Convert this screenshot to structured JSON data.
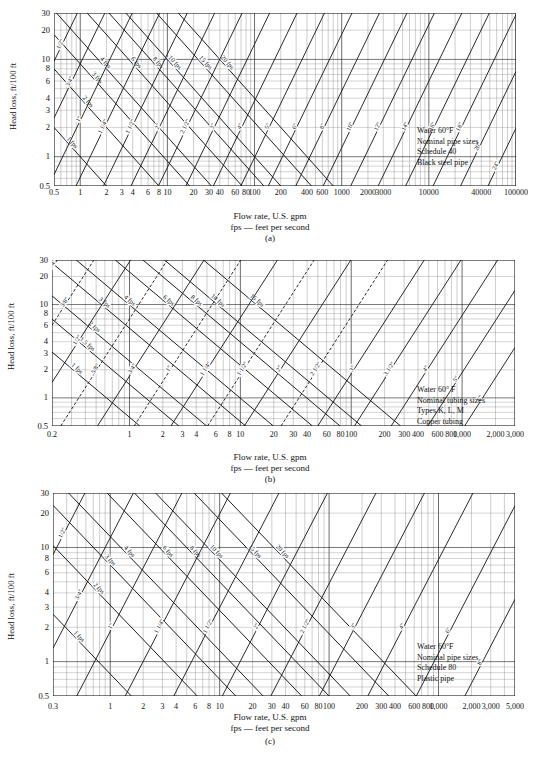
{
  "figure": {
    "axis_caption_line1": "Flow rate, U.S. gpm",
    "axis_caption_line2": "fps — feet per second",
    "y_axis_label": "Head loss, ft/100 ft"
  },
  "panels": [
    {
      "letter": "(a)",
      "legend": [
        "Water 60°F",
        "Nominal pipe sizes",
        "Schedule 40",
        "Black steel pipe"
      ],
      "y_ticks": [
        "30",
        "20",
        "10",
        "8",
        "6",
        "4",
        "3",
        "2",
        "1",
        "0.5"
      ],
      "x_ticks": [
        "0.5",
        "1",
        "2",
        "3",
        "4",
        "6",
        "8",
        "10",
        "20",
        "30",
        "40",
        "60",
        "80",
        "100",
        "200",
        "400",
        "600",
        "1000",
        "2000",
        "3000",
        "10000",
        "40000",
        "100000"
      ],
      "velocity_labels": [
        "1 fps",
        "2 fps",
        "3 fps",
        "4 fps",
        "6 fps",
        "8 fps",
        "10 fps",
        "15 fps",
        "20 fps"
      ],
      "pipe_size_labels": [
        "1/2\"",
        "3/4\"",
        "1\"",
        "1 1/4\"",
        "1 1/2\"",
        "2\"",
        "2 1/2\"",
        "3\"",
        "4\"",
        "5\"",
        "6\"",
        "8\"",
        "10\"",
        "12\"",
        "14\"",
        "16\"",
        "18\"",
        "20\"",
        "24\""
      ]
    },
    {
      "letter": "(b)",
      "legend": [
        "Water 60° F",
        "Nominal tubing sizes",
        "Types K, L, M",
        "Copper tubing"
      ],
      "y_ticks": [
        "30",
        "20",
        "10",
        "8",
        "6",
        "4",
        "3",
        "2",
        "1",
        "0.5"
      ],
      "x_ticks": [
        "0.2",
        "1",
        "2",
        "3",
        "4",
        "6",
        "8",
        "10",
        "20",
        "30",
        "40",
        "60",
        "80",
        "100",
        "200",
        "300",
        "400",
        "600",
        "800",
        "1,000",
        "2,000",
        "3,000"
      ],
      "velocity_labels": [
        "1 fps",
        "1.5 fps",
        "2 fps",
        "3 fps",
        "4 fps",
        "6 fps",
        "8 fps",
        "10 fps",
        "15 fps"
      ],
      "pipe_size_labels": [
        "1/4\"",
        "3/8\"",
        "1/2\"",
        "5/8\"",
        "3/4\"",
        "1\"",
        "1 1/4\"",
        "1 1/2\"",
        "2\"",
        "2 1/2\"",
        "3\"",
        "3 1/2\"",
        "4\"",
        "5\"",
        "6\""
      ]
    },
    {
      "letter": "(c)",
      "legend": [
        "Water 60°F",
        "Nominal pipe sizes",
        "Schedule 80",
        "Plastic pipe"
      ],
      "y_ticks": [
        "30",
        "20",
        "10",
        "8",
        "6",
        "4",
        "3",
        "2",
        "1",
        "0.5"
      ],
      "x_ticks": [
        "0.3",
        "1",
        "2",
        "3",
        "4",
        "6",
        "8",
        "10",
        "20",
        "30",
        "40",
        "60",
        "80",
        "100",
        "200",
        "300",
        "400",
        "600",
        "800",
        "1,000",
        "2,000",
        "3,000",
        "5,000"
      ],
      "velocity_labels": [
        "1 fps",
        "2 fps",
        "3 fps",
        "4 fps",
        "6 fps",
        "8 fps",
        "10 fps",
        "15 fps",
        "20 fps"
      ],
      "pipe_size_labels": [
        "1/2\"",
        "3/4\"",
        "1\"",
        "1 1/4\"",
        "1 1/2\"",
        "2\"",
        "2 1/2\"",
        "3\"",
        "4\"",
        "6\"",
        "8\""
      ]
    }
  ],
  "chart_data": [
    {
      "type": "line",
      "panel": "(a)",
      "title": "Head loss vs flow rate — Schedule 40 black steel pipe, water 60°F",
      "xlabel": "Flow rate, U.S. gpm",
      "ylabel": "Head loss, ft/100 ft",
      "xscale": "log",
      "yscale": "log",
      "xlim": [
        0.5,
        100000
      ],
      "ylim": [
        0.5,
        30
      ],
      "grid": true,
      "legend_position": "inside-right",
      "annotations": [
        "Water 60°F",
        "Nominal pipe sizes",
        "Schedule 40",
        "Black steel pipe"
      ],
      "x_tick_values": [
        0.5,
        1,
        2,
        3,
        4,
        6,
        8,
        10,
        20,
        30,
        40,
        60,
        80,
        100,
        200,
        400,
        600,
        1000,
        2000,
        3000,
        10000,
        40000,
        100000
      ],
      "y_tick_values": [
        0.5,
        1,
        2,
        3,
        4,
        6,
        8,
        10,
        20,
        30
      ],
      "series": [
        {
          "name": "1 fps",
          "kind": "velocity",
          "slope": -1.0,
          "points": [
            [
              0.5,
              2.0
            ],
            [
              100000,
              0.0002
            ]
          ]
        },
        {
          "name": "2 fps",
          "kind": "velocity",
          "slope": -1.0,
          "points": [
            [
              0.5,
              10.0
            ],
            [
              100000,
              0.001
            ]
          ]
        },
        {
          "name": "3 fps",
          "kind": "velocity",
          "slope": -1.0,
          "points": [
            [
              1.0,
              30.0
            ],
            [
              100000,
              0.004
            ]
          ]
        },
        {
          "name": "4 fps",
          "kind": "velocity",
          "slope": -1.0,
          "points": [
            [
              2.0,
              30.0
            ],
            [
              100000,
              0.01
            ]
          ]
        },
        {
          "name": "6 fps",
          "kind": "velocity",
          "slope": -1.0,
          "points": [
            [
              6.0,
              30.0
            ],
            [
              100000,
              0.03
            ]
          ]
        },
        {
          "name": "8 fps",
          "kind": "velocity",
          "slope": -1.0,
          "points": [
            [
              15.0,
              30.0
            ],
            [
              100000,
              0.06
            ]
          ]
        },
        {
          "name": "10 fps",
          "kind": "velocity",
          "slope": -1.0,
          "points": [
            [
              40.0,
              30.0
            ],
            [
              100000,
              0.1
            ]
          ]
        },
        {
          "name": "15 fps",
          "kind": "velocity",
          "slope": -1.0,
          "points": [
            [
              200.0,
              30.0
            ],
            [
              100000,
              0.25
            ]
          ]
        },
        {
          "name": "20 fps",
          "kind": "velocity",
          "slope": -1.0,
          "points": [
            [
              700.0,
              30.0
            ],
            [
              100000,
              0.5
            ]
          ]
        },
        {
          "name": "1/2\"",
          "kind": "pipe-size",
          "slope": 1.85
        },
        {
          "name": "3/4\"",
          "kind": "pipe-size",
          "slope": 1.85
        },
        {
          "name": "1\"",
          "kind": "pipe-size",
          "slope": 1.85
        },
        {
          "name": "1 1/4\"",
          "kind": "pipe-size",
          "slope": 1.85
        },
        {
          "name": "1 1/2\"",
          "kind": "pipe-size",
          "slope": 1.85
        },
        {
          "name": "2\"",
          "kind": "pipe-size",
          "slope": 1.85
        },
        {
          "name": "2 1/2\"",
          "kind": "pipe-size",
          "slope": 1.85
        },
        {
          "name": "3\"",
          "kind": "pipe-size",
          "slope": 1.85
        },
        {
          "name": "4\"",
          "kind": "pipe-size",
          "slope": 1.85
        },
        {
          "name": "5\"",
          "kind": "pipe-size",
          "slope": 1.85
        },
        {
          "name": "6\"",
          "kind": "pipe-size",
          "slope": 1.85
        },
        {
          "name": "8\"",
          "kind": "pipe-size",
          "slope": 1.85
        },
        {
          "name": "10\"",
          "kind": "pipe-size",
          "slope": 1.85
        },
        {
          "name": "12\"",
          "kind": "pipe-size",
          "slope": 1.85
        },
        {
          "name": "14\"",
          "kind": "pipe-size",
          "slope": 1.85
        },
        {
          "name": "16\"",
          "kind": "pipe-size",
          "slope": 1.85
        },
        {
          "name": "18\"",
          "kind": "pipe-size",
          "slope": 1.85
        },
        {
          "name": "20\"",
          "kind": "pipe-size",
          "slope": 1.85
        },
        {
          "name": "24\"",
          "kind": "pipe-size",
          "slope": 1.85
        }
      ]
    },
    {
      "type": "line",
      "panel": "(b)",
      "title": "Head loss vs flow rate — Copper tubing Types K, L, M, water 60°F",
      "xlabel": "Flow rate, U.S. gpm",
      "ylabel": "Head loss, ft/100 ft",
      "xscale": "log",
      "yscale": "log",
      "xlim": [
        0.2,
        3000
      ],
      "ylim": [
        0.5,
        30
      ],
      "grid": true,
      "legend_position": "inside-right",
      "annotations": [
        "Water 60° F",
        "Nominal tubing sizes",
        "Types K, L, M",
        "Copper tubing"
      ],
      "x_tick_values": [
        0.2,
        1,
        2,
        3,
        4,
        6,
        8,
        10,
        20,
        30,
        40,
        60,
        80,
        100,
        200,
        300,
        400,
        600,
        800,
        1000,
        2000,
        3000
      ],
      "y_tick_values": [
        0.5,
        1,
        2,
        3,
        4,
        6,
        8,
        10,
        20,
        30
      ],
      "series": [
        {
          "name": "1 fps",
          "kind": "velocity",
          "slope": -1.0
        },
        {
          "name": "1.5 fps",
          "kind": "velocity",
          "slope": -1.0
        },
        {
          "name": "2 fps",
          "kind": "velocity",
          "slope": -1.0
        },
        {
          "name": "3 fps",
          "kind": "velocity",
          "slope": -1.0
        },
        {
          "name": "4 fps",
          "kind": "velocity",
          "slope": -1.0
        },
        {
          "name": "6 fps",
          "kind": "velocity",
          "slope": -1.0
        },
        {
          "name": "8 fps",
          "kind": "velocity",
          "slope": -1.0
        },
        {
          "name": "10 fps",
          "kind": "velocity",
          "slope": -1.0
        },
        {
          "name": "15 fps",
          "kind": "velocity",
          "slope": -1.0
        },
        {
          "name": "1/4\"",
          "kind": "pipe-size",
          "slope": 1.85
        },
        {
          "name": "3/8\"",
          "kind": "pipe-size",
          "slope": 1.85
        },
        {
          "name": "1/2\"",
          "kind": "pipe-size",
          "slope": 1.85
        },
        {
          "name": "5/8\"",
          "kind": "pipe-size",
          "slope": 1.85
        },
        {
          "name": "3/4\"",
          "kind": "pipe-size",
          "slope": 1.85
        },
        {
          "name": "1\"",
          "kind": "pipe-size",
          "slope": 1.85
        },
        {
          "name": "1 1/4\"",
          "kind": "pipe-size",
          "slope": 1.85
        },
        {
          "name": "1 1/2\"",
          "kind": "pipe-size",
          "slope": 1.85
        },
        {
          "name": "2\"",
          "kind": "pipe-size",
          "slope": 1.85
        },
        {
          "name": "2 1/2\"",
          "kind": "pipe-size",
          "slope": 1.85
        },
        {
          "name": "3\"",
          "kind": "pipe-size",
          "slope": 1.85
        },
        {
          "name": "3 1/2\"",
          "kind": "pipe-size",
          "slope": 1.85
        },
        {
          "name": "4\"",
          "kind": "pipe-size",
          "slope": 1.85
        },
        {
          "name": "5\"",
          "kind": "pipe-size",
          "slope": 1.85
        },
        {
          "name": "6\"",
          "kind": "pipe-size",
          "slope": 1.85
        }
      ]
    },
    {
      "type": "line",
      "panel": "(c)",
      "title": "Head loss vs flow rate — Schedule 80 plastic pipe, water 60°F",
      "xlabel": "Flow rate, U.S. gpm",
      "ylabel": "Head loss, ft/100 ft",
      "xscale": "log",
      "yscale": "log",
      "xlim": [
        0.3,
        5000
      ],
      "ylim": [
        0.5,
        30
      ],
      "grid": true,
      "legend_position": "inside-right",
      "annotations": [
        "Water 60°F",
        "Nominal pipe sizes",
        "Schedule 80",
        "Plastic pipe"
      ],
      "x_tick_values": [
        0.3,
        1,
        2,
        3,
        4,
        6,
        8,
        10,
        20,
        30,
        40,
        60,
        80,
        100,
        200,
        300,
        400,
        600,
        800,
        1000,
        2000,
        3000,
        5000
      ],
      "y_tick_values": [
        0.5,
        1,
        2,
        3,
        4,
        6,
        8,
        10,
        20,
        30
      ],
      "series": [
        {
          "name": "1 fps",
          "kind": "velocity",
          "slope": -1.0
        },
        {
          "name": "2 fps",
          "kind": "velocity",
          "slope": -1.0
        },
        {
          "name": "3 fps",
          "kind": "velocity",
          "slope": -1.0
        },
        {
          "name": "4 fps",
          "kind": "velocity",
          "slope": -1.0
        },
        {
          "name": "6 fps",
          "kind": "velocity",
          "slope": -1.0
        },
        {
          "name": "8 fps",
          "kind": "velocity",
          "slope": -1.0
        },
        {
          "name": "10 fps",
          "kind": "velocity",
          "slope": -1.0
        },
        {
          "name": "15 fps",
          "kind": "velocity",
          "slope": -1.0
        },
        {
          "name": "20 fps",
          "kind": "velocity",
          "slope": -1.0
        },
        {
          "name": "1/2\"",
          "kind": "pipe-size",
          "slope": 1.85
        },
        {
          "name": "3/4\"",
          "kind": "pipe-size",
          "slope": 1.85
        },
        {
          "name": "1\"",
          "kind": "pipe-size",
          "slope": 1.85
        },
        {
          "name": "1 1/4\"",
          "kind": "pipe-size",
          "slope": 1.85
        },
        {
          "name": "1 1/2\"",
          "kind": "pipe-size",
          "slope": 1.85
        },
        {
          "name": "2\"",
          "kind": "pipe-size",
          "slope": 1.85
        },
        {
          "name": "2 1/2\"",
          "kind": "pipe-size",
          "slope": 1.85
        },
        {
          "name": "3\"",
          "kind": "pipe-size",
          "slope": 1.85
        },
        {
          "name": "4\"",
          "kind": "pipe-size",
          "slope": 1.85
        },
        {
          "name": "6\"",
          "kind": "pipe-size",
          "slope": 1.85
        },
        {
          "name": "8\"",
          "kind": "pipe-size",
          "slope": 1.85
        }
      ]
    }
  ]
}
